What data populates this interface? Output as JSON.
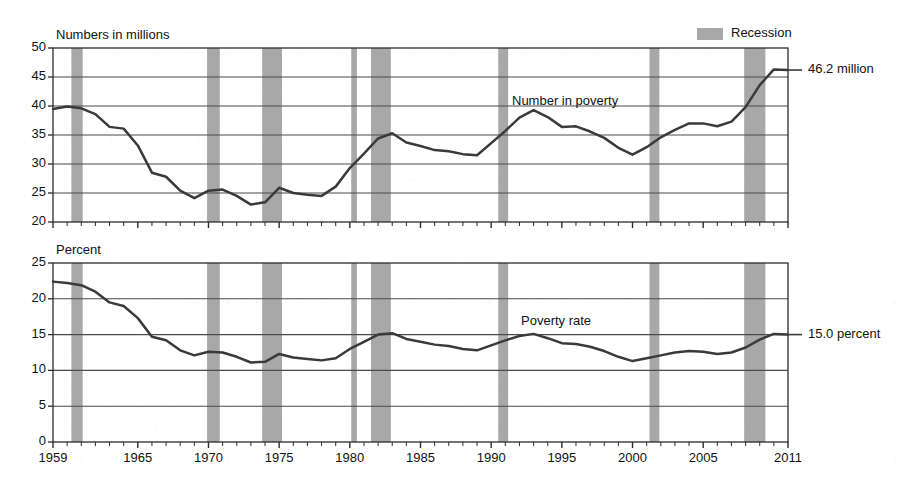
{
  "figure": {
    "legend": {
      "recession_label": "Recession",
      "recession_color": "#a8a8a8"
    },
    "line_color": "#3a3a3a",
    "axis_color": "#2b2b2b",
    "grid_color": "#4a4a4a"
  },
  "panels": {
    "top": {
      "axis_title": "Numbers in millions",
      "series_label": "Number in poverty",
      "end_label": "46.2 million"
    },
    "bottom": {
      "axis_title": "Percent",
      "series_label": "Poverty rate",
      "end_label": "15.0 percent"
    }
  },
  "chart_data": [
    {
      "type": "line",
      "title": "Number in poverty",
      "xlabel": "",
      "ylabel": "Numbers in millions",
      "ylim": [
        20,
        50
      ],
      "yticks": [
        20,
        25,
        30,
        35,
        40,
        45,
        50
      ],
      "xlim": [
        1959,
        2011
      ],
      "xticks": [
        1959,
        1965,
        1970,
        1975,
        1980,
        1985,
        1990,
        1995,
        2000,
        2005,
        2011
      ],
      "grid": true,
      "legend_position": "top-right",
      "annotations": [
        "Number in poverty",
        "46.2 million"
      ],
      "x": [
        1959,
        1960,
        1961,
        1962,
        1963,
        1964,
        1965,
        1966,
        1967,
        1968,
        1969,
        1970,
        1971,
        1972,
        1973,
        1974,
        1975,
        1976,
        1977,
        1978,
        1979,
        1980,
        1981,
        1982,
        1983,
        1984,
        1985,
        1986,
        1987,
        1988,
        1989,
        1990,
        1991,
        1992,
        1993,
        1994,
        1995,
        1996,
        1997,
        1998,
        1999,
        2000,
        2001,
        2002,
        2003,
        2004,
        2005,
        2006,
        2007,
        2008,
        2009,
        2010,
        2011
      ],
      "values": [
        39.5,
        39.9,
        39.6,
        38.6,
        36.4,
        36.1,
        33.2,
        28.5,
        27.8,
        25.4,
        24.1,
        25.4,
        25.6,
        24.5,
        23.0,
        23.4,
        25.9,
        25.0,
        24.7,
        24.5,
        26.1,
        29.3,
        31.8,
        34.4,
        35.3,
        33.7,
        33.1,
        32.4,
        32.2,
        31.7,
        31.5,
        33.6,
        35.7,
        38.0,
        39.3,
        38.1,
        36.4,
        36.5,
        35.6,
        34.5,
        32.8,
        31.6,
        32.9,
        34.6,
        35.9,
        37.0,
        37.0,
        36.5,
        37.3,
        39.8,
        43.6,
        46.3,
        46.2
      ],
      "data_source_note": ""
    },
    {
      "type": "line",
      "title": "Poverty rate",
      "xlabel": "",
      "ylabel": "Percent",
      "ylim": [
        0,
        25
      ],
      "yticks": [
        0,
        5,
        10,
        15,
        20,
        25
      ],
      "xlim": [
        1959,
        2011
      ],
      "xticks": [
        1959,
        1965,
        1970,
        1975,
        1980,
        1985,
        1990,
        1995,
        2000,
        2005,
        2011
      ],
      "grid": true,
      "legend_position": "top-right",
      "annotations": [
        "Poverty rate",
        "15.0 percent"
      ],
      "x": [
        1959,
        1960,
        1961,
        1962,
        1963,
        1964,
        1965,
        1966,
        1967,
        1968,
        1969,
        1970,
        1971,
        1972,
        1973,
        1974,
        1975,
        1976,
        1977,
        1978,
        1979,
        1980,
        1981,
        1982,
        1983,
        1984,
        1985,
        1986,
        1987,
        1988,
        1989,
        1990,
        1991,
        1992,
        1993,
        1994,
        1995,
        1996,
        1997,
        1998,
        1999,
        2000,
        2001,
        2002,
        2003,
        2004,
        2005,
        2006,
        2007,
        2008,
        2009,
        2010,
        2011
      ],
      "values": [
        22.4,
        22.2,
        21.9,
        21.0,
        19.5,
        19.0,
        17.3,
        14.7,
        14.2,
        12.8,
        12.1,
        12.6,
        12.5,
        11.9,
        11.1,
        11.2,
        12.3,
        11.8,
        11.6,
        11.4,
        11.7,
        13.0,
        14.0,
        15.0,
        15.2,
        14.4,
        14.0,
        13.6,
        13.4,
        13.0,
        12.8,
        13.5,
        14.2,
        14.8,
        15.1,
        14.5,
        13.8,
        13.7,
        13.3,
        12.7,
        11.9,
        11.3,
        11.7,
        12.1,
        12.5,
        12.7,
        12.6,
        12.3,
        12.5,
        13.2,
        14.3,
        15.1,
        15.0
      ]
    }
  ],
  "recessions": [
    {
      "label": "1960-1961",
      "start": 1960.3,
      "end": 1961.1
    },
    {
      "label": "1969-1970",
      "start": 1969.9,
      "end": 1970.8
    },
    {
      "label": "1973-1975",
      "start": 1973.8,
      "end": 1975.2
    },
    {
      "label": "1980",
      "start": 1980.1,
      "end": 1980.5
    },
    {
      "label": "1981-1982",
      "start": 1981.5,
      "end": 1982.9
    },
    {
      "label": "1990-1991",
      "start": 1990.5,
      "end": 1991.2
    },
    {
      "label": "2001",
      "start": 2001.2,
      "end": 2001.9
    },
    {
      "label": "2007-2009",
      "start": 2007.9,
      "end": 2009.4
    }
  ]
}
